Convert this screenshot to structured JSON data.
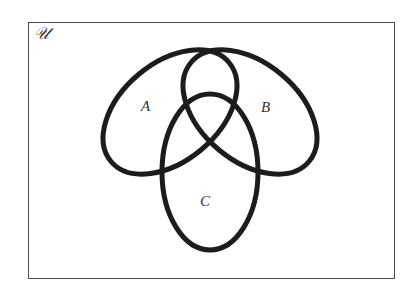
{
  "diagram": {
    "type": "venn-diagram",
    "universe": {
      "label": "𝒰",
      "frame": {
        "x": 28,
        "y": 22,
        "width": 367,
        "height": 257
      }
    },
    "stroke_color": "#1c1c1c",
    "stroke_width": 5,
    "sets": [
      {
        "name": "A",
        "label": "A",
        "shape": "ellipse",
        "cx": 170,
        "cy": 112,
        "rx": 77,
        "ry": 49,
        "rotate": -40,
        "label_pos": {
          "x": 141,
          "y": 99
        }
      },
      {
        "name": "B",
        "label": "B",
        "shape": "ellipse",
        "cx": 250,
        "cy": 112,
        "rx": 77,
        "ry": 49,
        "rotate": 40,
        "label_pos": {
          "x": 261,
          "y": 100
        }
      },
      {
        "name": "C",
        "label": "C",
        "shape": "ellipse",
        "cx": 210,
        "cy": 172,
        "rx": 48,
        "ry": 78,
        "rotate": 0,
        "label_pos": {
          "x": 200,
          "y": 194
        }
      }
    ]
  }
}
